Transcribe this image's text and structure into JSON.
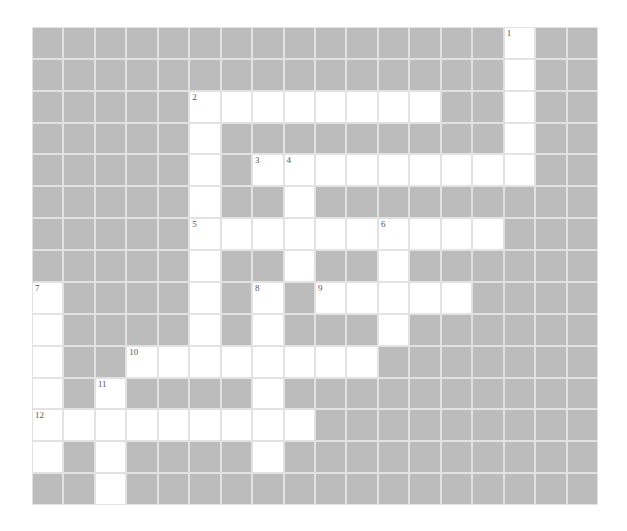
{
  "puzzle": {
    "rows": 15,
    "cols": 18,
    "colors": {
      "block": "#bcbcbc",
      "open": "#ffffff",
      "gridline": "#e2e2e2",
      "number": "#555555"
    },
    "open_cells": [
      [
        0,
        15
      ],
      [
        1,
        15
      ],
      [
        2,
        5
      ],
      [
        2,
        6
      ],
      [
        2,
        7
      ],
      [
        2,
        8
      ],
      [
        2,
        9
      ],
      [
        2,
        10
      ],
      [
        2,
        11
      ],
      [
        2,
        12
      ],
      [
        2,
        15
      ],
      [
        3,
        5
      ],
      [
        3,
        15
      ],
      [
        4,
        5
      ],
      [
        4,
        7
      ],
      [
        4,
        8
      ],
      [
        4,
        9
      ],
      [
        4,
        10
      ],
      [
        4,
        11
      ],
      [
        4,
        12
      ],
      [
        4,
        13
      ],
      [
        4,
        14
      ],
      [
        4,
        15
      ],
      [
        5,
        5
      ],
      [
        5,
        8
      ],
      [
        6,
        5
      ],
      [
        6,
        6
      ],
      [
        6,
        7
      ],
      [
        6,
        8
      ],
      [
        6,
        9
      ],
      [
        6,
        10
      ],
      [
        6,
        11
      ],
      [
        6,
        12
      ],
      [
        6,
        13
      ],
      [
        6,
        14
      ],
      [
        7,
        5
      ],
      [
        7,
        8
      ],
      [
        7,
        11
      ],
      [
        8,
        0
      ],
      [
        8,
        5
      ],
      [
        8,
        7
      ],
      [
        8,
        9
      ],
      [
        8,
        10
      ],
      [
        8,
        11
      ],
      [
        8,
        12
      ],
      [
        8,
        13
      ],
      [
        9,
        0
      ],
      [
        9,
        5
      ],
      [
        9,
        7
      ],
      [
        9,
        11
      ],
      [
        10,
        0
      ],
      [
        10,
        3
      ],
      [
        10,
        4
      ],
      [
        10,
        5
      ],
      [
        10,
        6
      ],
      [
        10,
        7
      ],
      [
        10,
        8
      ],
      [
        10,
        9
      ],
      [
        10,
        10
      ],
      [
        11,
        0
      ],
      [
        11,
        2
      ],
      [
        11,
        7
      ],
      [
        12,
        0
      ],
      [
        12,
        1
      ],
      [
        12,
        2
      ],
      [
        12,
        3
      ],
      [
        12,
        4
      ],
      [
        12,
        5
      ],
      [
        12,
        6
      ],
      [
        12,
        7
      ],
      [
        12,
        8
      ],
      [
        13,
        0
      ],
      [
        13,
        2
      ],
      [
        13,
        7
      ],
      [
        14,
        2
      ]
    ],
    "numbers": [
      {
        "row": 0,
        "col": 15,
        "label": "1"
      },
      {
        "row": 2,
        "col": 5,
        "label": "2"
      },
      {
        "row": 4,
        "col": 7,
        "label": "3"
      },
      {
        "row": 4,
        "col": 8,
        "label": "4"
      },
      {
        "row": 6,
        "col": 5,
        "label": "5"
      },
      {
        "row": 6,
        "col": 11,
        "label": "6"
      },
      {
        "row": 8,
        "col": 0,
        "label": "7"
      },
      {
        "row": 8,
        "col": 7,
        "label": "8"
      },
      {
        "row": 8,
        "col": 9,
        "label": "9"
      },
      {
        "row": 10,
        "col": 3,
        "label": "10"
      },
      {
        "row": 11,
        "col": 2,
        "label": "11"
      },
      {
        "row": 12,
        "col": 0,
        "label": "12"
      }
    ]
  }
}
